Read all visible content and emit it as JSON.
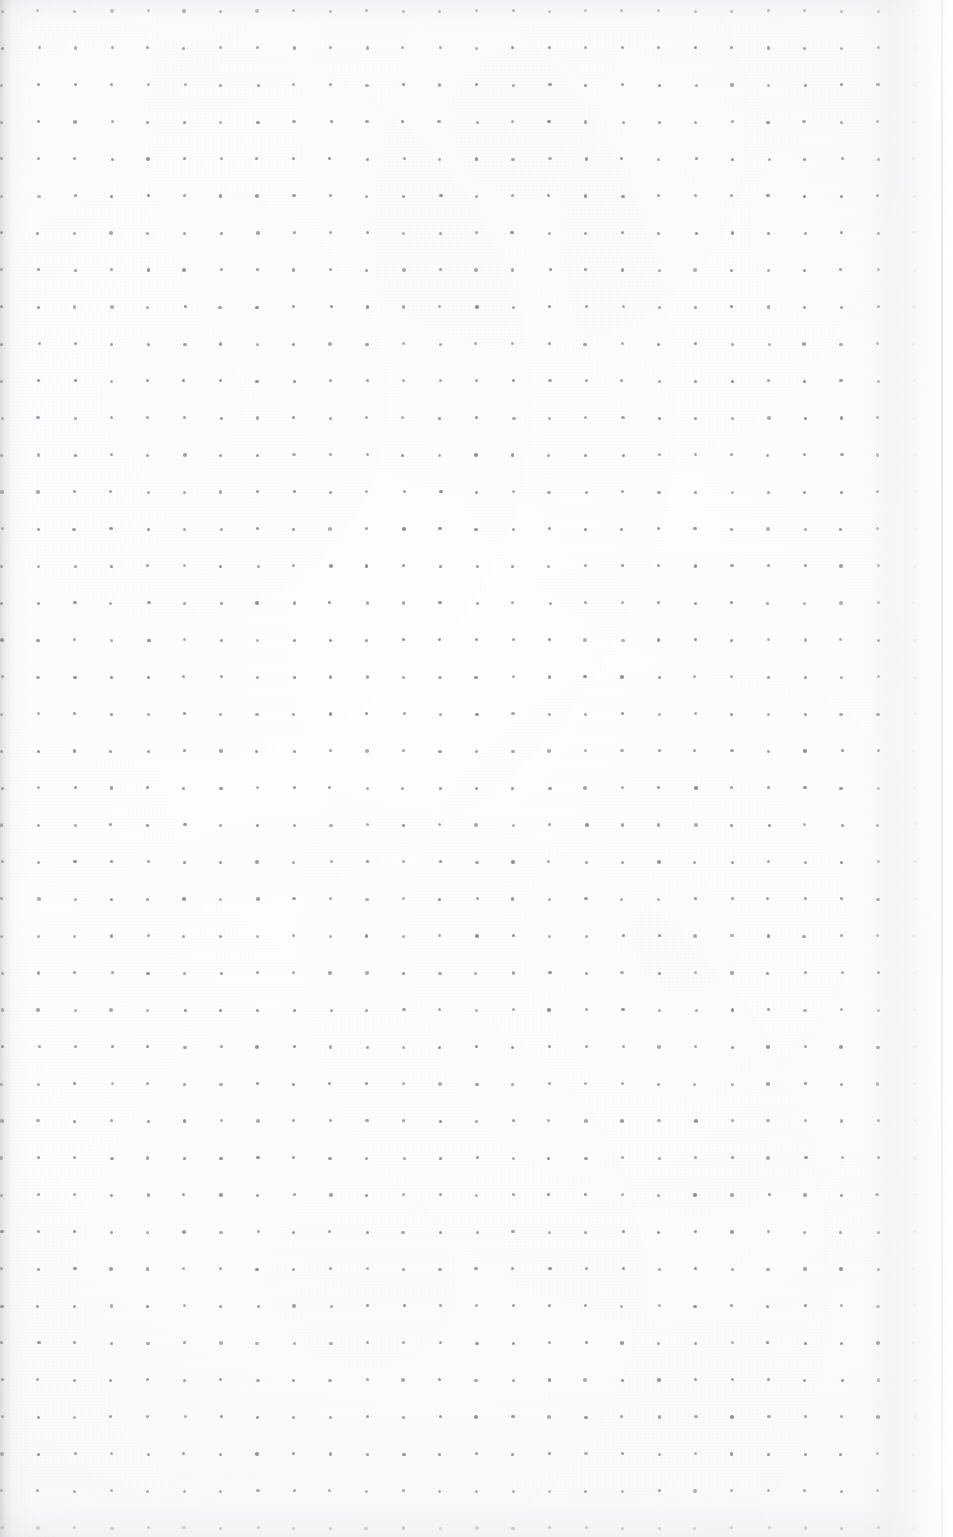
{
  "document": {
    "kind": "dot-grid-notebook-page",
    "title": "Dot Grid Notebook Page",
    "description": "Blank scanned dot-grid (bullet journal) notebook page",
    "content_text": "",
    "has_handwriting": false,
    "has_printed_text": false,
    "page_width": 953,
    "page_height": 1537
  },
  "colors": {
    "paper": "#fdfdfd",
    "paper_edge": "#f4f4f6",
    "dot": "#8e8e96",
    "backdrop": "#ffffff",
    "shadow": "#c4c4cb"
  },
  "grid": {
    "label": "dot-grid",
    "dot_diameter_px": 3,
    "spacing_x_px": 36.5,
    "spacing_y_px": 37,
    "origin_x_px": 2,
    "origin_y_px": 11,
    "columns": 26,
    "rows": 42,
    "dot_color": "#8e8e96"
  },
  "edges": {
    "left_label": "left-binding-shadow",
    "right_label": "right-page-edge",
    "top_label": "top-edge-shading",
    "bottom_label": "bottom-edge-shading",
    "corner_label": "rounded-top-left-corner",
    "right_edge_x_px": 943
  }
}
